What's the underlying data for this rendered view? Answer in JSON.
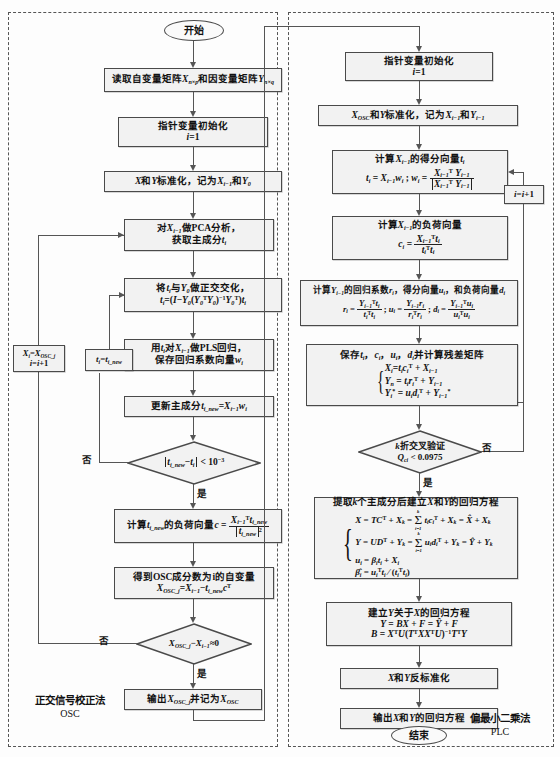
{
  "figure": {
    "type": "flowchart",
    "width": 560,
    "height": 757
  },
  "panels": [
    {
      "id": "osc",
      "caption_title": "正交信号校正法",
      "caption_sub": "OSC"
    },
    {
      "id": "pls",
      "caption_title": "偏最小二乘法",
      "caption_sub": "PLC"
    }
  ],
  "osc": {
    "start": "开始",
    "read_matrices": {
      "text": "读取自变量矩阵",
      "x_sym": "X",
      "x_dim": "n×p",
      "mid": "和因变量矩阵",
      "y_sym": "Y",
      "y_dim": "n×q"
    },
    "init_pointer": {
      "line1": "指针变量初始化",
      "line2": "i=1"
    },
    "standardize": "X和Y标准化，记为X",
    "standardize_full": "X和Y标准化，记为X(i-1)和Y0",
    "pca": {
      "line1": "对X(i-1)做PCA分析，",
      "line2": "获取主成分t(i)"
    },
    "orthogonalize": {
      "line1": "将t(i)与Y0做正交化，",
      "line2": "t(i)=(I-Y0(Y0^T Y0)^-1 Y0^T)t(i)"
    },
    "pls_regression": {
      "line1": "用t(i)对X(i-1)做PLS回归，",
      "line2": "保存回归系数向量w(i)"
    },
    "update_component": "更新主成分 t(i_new)=X(i-1) w(i)",
    "decision_converge": {
      "expr": "||t(i_new) - t(i)|| < 10^-3",
      "yes": "是",
      "no": "否"
    },
    "loop_back_t": "t(i)=t(i_new)",
    "loading_vector": {
      "text": "计算t(i_new)的负荷向量 c =",
      "num": "X(i-1)^T t(i_new)",
      "den": "||t(i_new)||^2"
    },
    "osc_component": {
      "line1": "得到OSC成分数为i的自变量",
      "line2": "X(OSC_j)=X(i-1) - t(i_new) c^T"
    },
    "decision_osc": {
      "expr": "X(OSC_j) - X(i-1) ≈ 0",
      "yes": "是",
      "no": "否"
    },
    "loop_back_x": {
      "line1": "X(i)=X(OSC_j)",
      "line2": "i=i+1"
    },
    "output": "输出X(OSC_j)并记为X(OSC)"
  },
  "pls": {
    "init_pointer": {
      "line1": "指针变量初始化",
      "line2": "i=1"
    },
    "standardize": "X(OSC)和Y标准化，记为X(i-1)和Y(i-1)",
    "score_vector": {
      "line1": "计算X(i-1)的得分向量t(i)",
      "line2": "t(i) = X(i-1) w(i) ;  w(i) = X(i-1)^T Y(i-1) / ||X(i-1)^T Y(i-1)||"
    },
    "loading_vector": {
      "line1": "计算X(i-1)的负荷向量",
      "line2": "c(i) = X(i-1)^T t(i) / (t(i)^T t(i))"
    },
    "regression_coeffs": {
      "line1": "计算Y(i-1)的回归系数r(i)，得分向量u(i)，和负荷向量d(i)",
      "line2": "r(i) = Y(i-1)^T t(i)/(t(i)^T t(i)) ; u(i) = Y(i-1) r(i)/(r(i)^T r(i)) ; d(i) = Y(i-1)^T u(i)/(u(i)^T u(i))"
    },
    "save_residual": {
      "title": "保存t(i)，c(i)，u(i)，d(i)并计算残差矩阵",
      "eq1": "X(i)=t(i)c(i)^T + X(i-1)",
      "eq2": "Y(i) = t(i) r(i)^T + Y(i-1)",
      "eq3": "Y(i)* = u(i) d(i)^T + Y(i-1)*"
    },
    "decision_cv": {
      "line1": "k折交叉验证",
      "line2": "Q(i)^2 < 0.0975",
      "yes": "是",
      "no": "否"
    },
    "increment": "i=i+1",
    "final_regression": {
      "title": "提取k个主成分后建立X和Y的回归方程",
      "eq1": "X = TC^T + X(k) = Σ(i=1..k) t(i)c(i)^T + X(k) = X̂ + X(k)",
      "eq2": "Y = UD^T + Y(k) = Σ(i=1..k) u(i)d(i)^T + Y(k) = Ŷ + Y(k)",
      "eq3": "u(i) = β(i) t(i) + X(i)",
      "eq4": "β̂(i) = u(i)^T t(i) / (t(i)^T t(i))"
    },
    "y_on_x": {
      "title": "建立Y关于X的回归方程",
      "eq1": "Y = BX + F = Ŷ + F",
      "eq2": "B = X^T U(T^T XX^T U)^-1 T^T Y"
    },
    "destandardize": "X和Y反标准化",
    "output": "输出X和Y的回归方程",
    "end": "结束"
  },
  "colors": {
    "node_fill": "#f2f2f2",
    "node_border": "#4a4a4a",
    "line": "#555555",
    "panel_border": "#555555",
    "text": "#111111"
  }
}
